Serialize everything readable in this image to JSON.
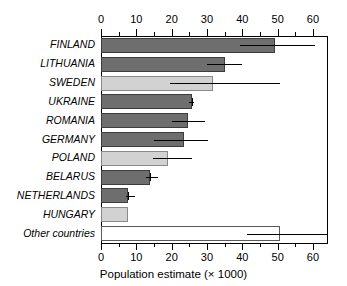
{
  "chart_data": {
    "type": "bar",
    "orientation": "horizontal",
    "title": "",
    "xlabel": "Population estimate (× 1000)",
    "ylabel": "",
    "xlim": [
      0,
      64.2
    ],
    "xticks": [
      0,
      10,
      20,
      30,
      40,
      50,
      60
    ],
    "xtick_labels": [
      "0",
      "10",
      "20",
      "30",
      "40",
      "50",
      "60"
    ],
    "minor_tick_step": 5,
    "grid": false,
    "legend": null,
    "axis_top": true,
    "axis_bottom": true,
    "categories": [
      "FINLAND",
      "LITHUANIA",
      "SWEDEN",
      "UKRAINE",
      "ROMANIA",
      "GERMANY",
      "POLAND",
      "BELARUS",
      "NETHERLANDS",
      "HUNGARY",
      "Other countries"
    ],
    "values": [
      49.3,
      35.1,
      31.7,
      25.8,
      24.6,
      23.5,
      19.0,
      13.9,
      7.7,
      7.6,
      50.7
    ],
    "errors_low": [
      39.4,
      30.1,
      19.6,
      24.9,
      20.0,
      14.9,
      14.8,
      12.7,
      7.2,
      null,
      41.4
    ],
    "errors_high": [
      60.6,
      40.0,
      50.7,
      26.4,
      29.5,
      30.3,
      25.8,
      16.2,
      9.6,
      null,
      64.2
    ],
    "bar_fills": [
      "dark",
      "dark",
      "light",
      "dark",
      "dark",
      "dark",
      "light",
      "dark",
      "dark",
      "light",
      "white"
    ],
    "colors": {
      "dark": "#6e6e6e",
      "light": "#d2d2d2",
      "white": "#ffffff",
      "outline": "#3d3d3d",
      "axis": "#000000",
      "error": "#000000"
    }
  }
}
